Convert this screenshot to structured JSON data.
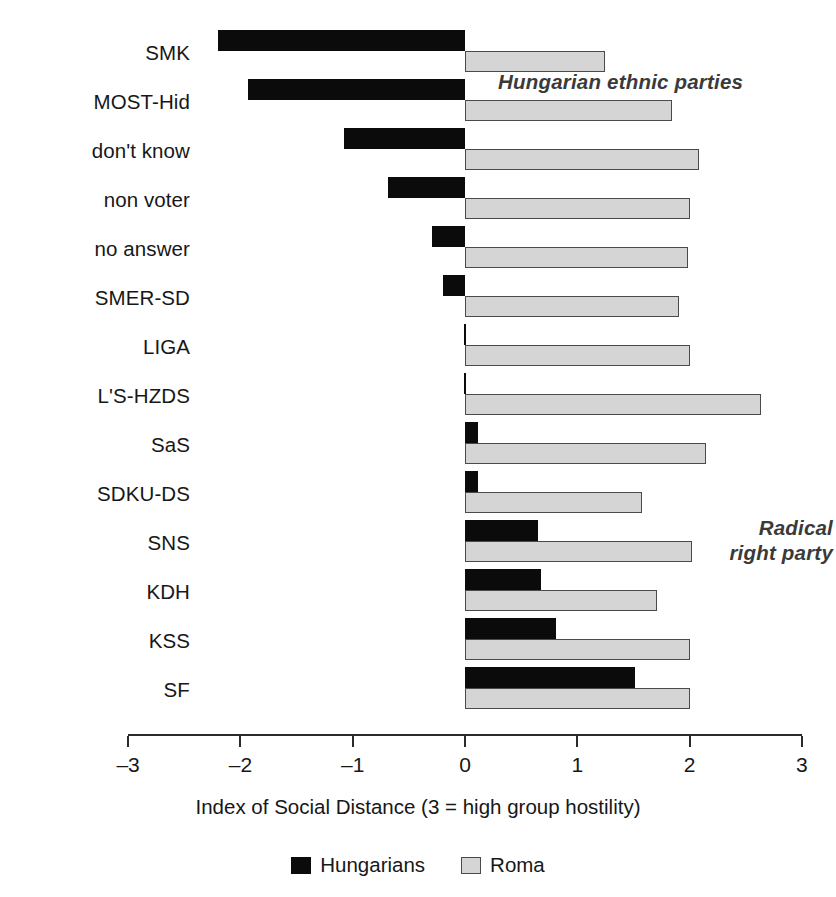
{
  "chart_data": {
    "type": "bar",
    "orientation": "horizontal",
    "title": "",
    "xlabel": "Index of Social Distance (3 = high group hostility)",
    "ylabel": "",
    "xlim": [
      -3,
      3
    ],
    "xticks": [
      -3,
      -2,
      -1,
      0,
      1,
      2,
      3
    ],
    "xtick_labels": [
      "–3",
      "–2",
      "–1",
      "0",
      "1",
      "2",
      "3"
    ],
    "grid": false,
    "legend_position": "bottom",
    "categories": [
      "SMK",
      "MOST-Hid",
      "don't know",
      "non voter",
      "no answer",
      "SMER-SD",
      "LIGA",
      "L'S-HZDS",
      "SaS",
      "SDKU-DS",
      "SNS",
      "KDH",
      "KSS",
      "SF"
    ],
    "series": [
      {
        "name": "Hungarians",
        "color": "#0b0b0b",
        "values": [
          -2.2,
          -1.93,
          -1.08,
          -0.69,
          -0.29,
          -0.2,
          0.0,
          0.0,
          0.12,
          0.12,
          0.65,
          0.68,
          0.81,
          1.51
        ]
      },
      {
        "name": "Roma",
        "color": "#d5d5d5",
        "values": [
          1.25,
          1.84,
          2.08,
          2.0,
          1.99,
          1.91,
          2.0,
          2.64,
          2.15,
          1.58,
          2.02,
          1.71,
          2.0,
          2.0
        ]
      }
    ],
    "annotations": [
      {
        "text": "Hungarian ethnic parties",
        "name": "hungarian-parties"
      },
      {
        "text": "Radical\nright party",
        "name": "radical-right"
      }
    ]
  },
  "legend": {
    "items": [
      {
        "label": "Hungarians",
        "swatch": "black-square-swatch"
      },
      {
        "label": "Roma",
        "swatch": "gray-square-swatch"
      }
    ]
  }
}
